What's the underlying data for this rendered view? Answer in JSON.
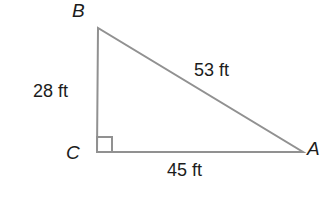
{
  "figure": {
    "type": "right-triangle-diagram",
    "background_color": "#ffffff",
    "line_color": "#919191",
    "text_color": "#1c1c1c",
    "right_angle_at": "C",
    "vertices": [
      {
        "name": "B",
        "position": "top"
      },
      {
        "name": "C",
        "position": "bottom-left"
      },
      {
        "name": "A",
        "position": "bottom-right"
      }
    ],
    "sides": [
      {
        "side": "BC",
        "label": "28 ft"
      },
      {
        "side": "BA",
        "label": "53 ft"
      },
      {
        "side": "CA",
        "label": "45 ft"
      }
    ]
  }
}
